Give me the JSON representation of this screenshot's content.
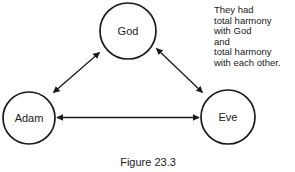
{
  "figure": {
    "caption": "Figure 23.3",
    "background_color": "#ffffff",
    "stroke_color": "#1a1a1a",
    "text_color": "#1a1a1a"
  },
  "nodes": [
    {
      "id": "god",
      "label": "God",
      "cx": 128,
      "cy": 31,
      "r": 28
    },
    {
      "id": "adam",
      "label": "Adam",
      "cx": 29,
      "cy": 118,
      "r": 26
    },
    {
      "id": "eve",
      "label": "Eve",
      "cx": 228,
      "cy": 117,
      "r": 27
    }
  ],
  "edges": [
    {
      "id": "adam-god",
      "from": "Adam",
      "to": "God",
      "style": "double-arrow"
    },
    {
      "id": "god-eve",
      "from": "God",
      "to": "Eve",
      "style": "double-arrow"
    },
    {
      "id": "adam-eve",
      "from": "Adam",
      "to": "Eve",
      "style": "double-arrow"
    }
  ],
  "annotation": {
    "lines": [
      "They had",
      "total harmony",
      "with God",
      "and",
      "total harmony",
      "with each other."
    ]
  }
}
